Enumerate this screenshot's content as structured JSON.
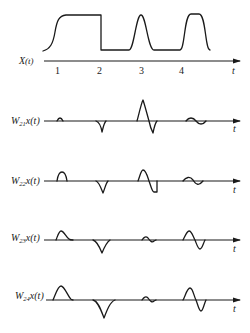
{
  "figure": {
    "signal": {
      "label_main": "X",
      "label_arg": "(t)",
      "axis_label": "t",
      "ticks": [
        "1",
        "2",
        "3",
        "4"
      ]
    },
    "panels": [
      {
        "label_base": "W",
        "label_sub": "21",
        "label_rest": "x(t)",
        "axis_label": "t"
      },
      {
        "label_base": "W",
        "label_sub": "22",
        "label_rest": "x(t)",
        "axis_label": "t"
      },
      {
        "label_base": "W",
        "label_sub": "23",
        "label_rest": "x(t)",
        "axis_label": "t"
      },
      {
        "label_base": "W",
        "label_sub": "24",
        "label_rest": "x(t)",
        "axis_label": "t"
      }
    ]
  }
}
